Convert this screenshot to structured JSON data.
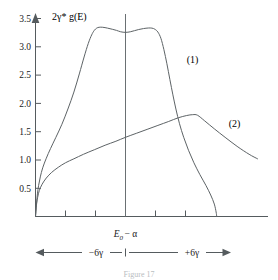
{
  "figure": {
    "y_axis_title": "2γ* g(E)",
    "x_center_label": "E0 − α",
    "x_center_label_parts": {
      "base": "E",
      "sub": "0",
      "rest": "− α"
    },
    "left_span_label": "−6γ",
    "right_span_label": "+6γ",
    "curve1_label": "(1)",
    "curve2_label": "(2)",
    "caption": "Figure 17"
  },
  "chart_data": {
    "type": "line",
    "title": "",
    "xlabel": "E0 − α",
    "ylabel": "2γ* g(E)",
    "ylim": [
      0,
      3.7
    ],
    "xlim": [
      -7.5,
      7.5
    ],
    "grid": false,
    "legend_position": "inline-annotations",
    "y_ticks": [
      "0.5",
      "1.0",
      "1.5",
      "2.0",
      "2.5",
      "3.0",
      "3.5"
    ],
    "y_tick_values": [
      0.5,
      1.0,
      1.5,
      2.0,
      2.5,
      3.0,
      3.5
    ],
    "x_tick_values": [
      -6,
      -3,
      0,
      3,
      6
    ],
    "x_tick_labels": [
      "",
      "",
      "",
      "",
      ""
    ],
    "axis_arrows": {
      "y_top": true,
      "x_right": false
    },
    "series": [
      {
        "name": "(1)",
        "label": "(1)",
        "label_x": 5.1,
        "label_y": 2.72,
        "points": [
          [
            -7.5,
            0.0
          ],
          [
            -7.42,
            0.22
          ],
          [
            -7.34,
            0.4
          ],
          [
            -7.24,
            0.55
          ],
          [
            -7.1,
            0.7
          ],
          [
            -6.9,
            0.86
          ],
          [
            -6.6,
            1.03
          ],
          [
            -6.25,
            1.2
          ],
          [
            -5.8,
            1.4
          ],
          [
            -5.3,
            1.63
          ],
          [
            -4.8,
            1.9
          ],
          [
            -4.3,
            2.2
          ],
          [
            -3.85,
            2.52
          ],
          [
            -3.45,
            2.82
          ],
          [
            -3.1,
            3.06
          ],
          [
            -2.82,
            3.21
          ],
          [
            -2.6,
            3.29
          ],
          [
            -2.4,
            3.33
          ],
          [
            -2.2,
            3.345
          ],
          [
            -1.9,
            3.345
          ],
          [
            -1.5,
            3.33
          ],
          [
            -1.1,
            3.31
          ],
          [
            -0.75,
            3.29
          ],
          [
            -0.4,
            3.265
          ],
          [
            0.0,
            3.255
          ],
          [
            0.4,
            3.265
          ],
          [
            0.75,
            3.285
          ],
          [
            1.1,
            3.305
          ],
          [
            1.5,
            3.322
          ],
          [
            1.9,
            3.332
          ],
          [
            2.2,
            3.33
          ],
          [
            2.45,
            3.31
          ],
          [
            2.7,
            3.26
          ],
          [
            2.95,
            3.15
          ],
          [
            3.2,
            2.95
          ],
          [
            3.45,
            2.7
          ],
          [
            3.7,
            2.42
          ],
          [
            3.95,
            2.15
          ],
          [
            4.2,
            1.9
          ],
          [
            4.5,
            1.64
          ],
          [
            4.85,
            1.4
          ],
          [
            5.25,
            1.17
          ],
          [
            5.7,
            0.95
          ],
          [
            6.2,
            0.74
          ],
          [
            6.7,
            0.55
          ],
          [
            7.1,
            0.38
          ],
          [
            7.4,
            0.22
          ],
          [
            7.55,
            0.08
          ],
          [
            7.6,
            0.0
          ]
        ]
      },
      {
        "name": "(2)",
        "label": "(2)",
        "label_x": 8.6,
        "label_y": 1.58,
        "points": [
          [
            -7.5,
            0.0
          ],
          [
            -7.42,
            0.2
          ],
          [
            -7.32,
            0.34
          ],
          [
            -7.18,
            0.46
          ],
          [
            -6.95,
            0.57
          ],
          [
            -6.6,
            0.68
          ],
          [
            -6.15,
            0.78
          ],
          [
            -5.6,
            0.87
          ],
          [
            -5.0,
            0.95
          ],
          [
            -4.3,
            1.02
          ],
          [
            -3.5,
            1.1
          ],
          [
            -2.6,
            1.18
          ],
          [
            -1.7,
            1.26
          ],
          [
            -0.8,
            1.33
          ],
          [
            0.0,
            1.4
          ],
          [
            0.9,
            1.47
          ],
          [
            1.8,
            1.54
          ],
          [
            2.7,
            1.61
          ],
          [
            3.6,
            1.68
          ],
          [
            4.4,
            1.745
          ],
          [
            5.1,
            1.785
          ],
          [
            5.6,
            1.8
          ],
          [
            6.0,
            1.79
          ],
          [
            6.6,
            1.69
          ],
          [
            7.4,
            1.55
          ],
          [
            8.3,
            1.4
          ],
          [
            9.3,
            1.24
          ],
          [
            10.3,
            1.1
          ],
          [
            11.0,
            1.02
          ]
        ]
      }
    ],
    "annotations": [
      {
        "name": "center-vertical-line",
        "x": 0,
        "y_from": 0,
        "y_to": 3.7
      },
      {
        "name": "span-arrow",
        "label_left": "−6γ",
        "label_right": "+6γ",
        "from_x": -7.5,
        "to_x": 7.5
      }
    ]
  }
}
